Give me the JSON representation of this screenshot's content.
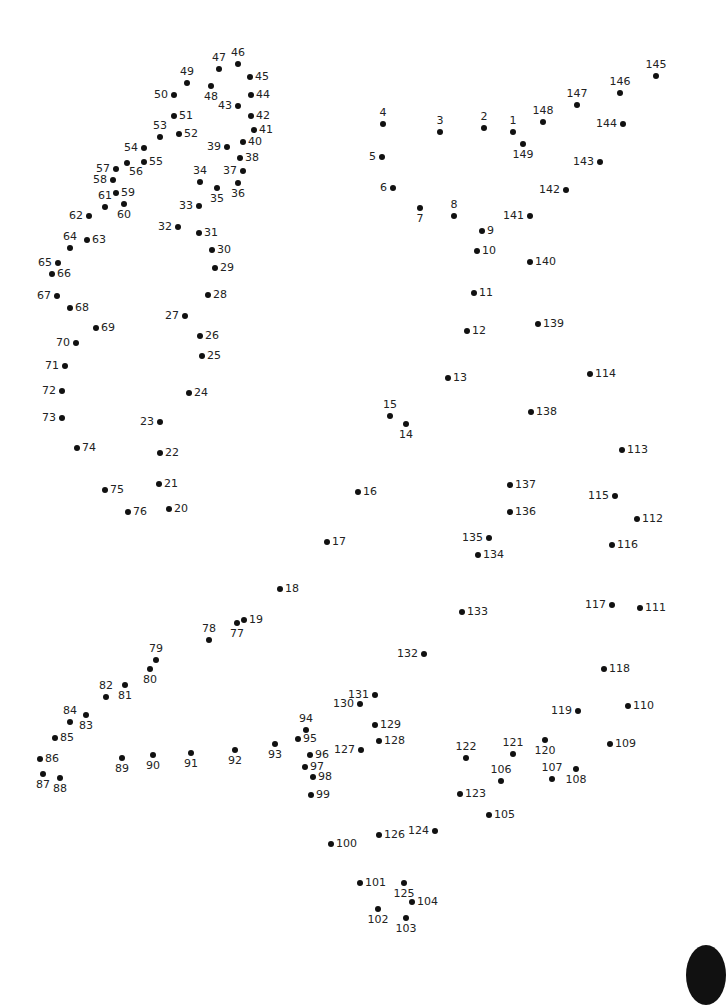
{
  "puzzle": {
    "type": "connect-the-dots",
    "dot_color": "#111111",
    "label_color": "#222222",
    "total_dots": 149,
    "dots": [
      {
        "n": 1,
        "x": 513,
        "y": 132,
        "pos": "above"
      },
      {
        "n": 2,
        "x": 484,
        "y": 128,
        "pos": "above"
      },
      {
        "n": 3,
        "x": 440,
        "y": 132,
        "pos": "above"
      },
      {
        "n": 4,
        "x": 383,
        "y": 124,
        "pos": "above"
      },
      {
        "n": 5,
        "x": 382,
        "y": 157,
        "pos": "left"
      },
      {
        "n": 6,
        "x": 393,
        "y": 188,
        "pos": "left"
      },
      {
        "n": 7,
        "x": 420,
        "y": 208,
        "pos": "below"
      },
      {
        "n": 8,
        "x": 454,
        "y": 216,
        "pos": "above"
      },
      {
        "n": 9,
        "x": 482,
        "y": 231,
        "pos": "right"
      },
      {
        "n": 10,
        "x": 477,
        "y": 251,
        "pos": "right"
      },
      {
        "n": 11,
        "x": 474,
        "y": 293,
        "pos": "right"
      },
      {
        "n": 12,
        "x": 467,
        "y": 331,
        "pos": "right"
      },
      {
        "n": 13,
        "x": 448,
        "y": 378,
        "pos": "right"
      },
      {
        "n": 14,
        "x": 406,
        "y": 424,
        "pos": "below"
      },
      {
        "n": 15,
        "x": 390,
        "y": 416,
        "pos": "above"
      },
      {
        "n": 16,
        "x": 358,
        "y": 492,
        "pos": "right"
      },
      {
        "n": 17,
        "x": 327,
        "y": 542,
        "pos": "right"
      },
      {
        "n": 18,
        "x": 280,
        "y": 589,
        "pos": "right"
      },
      {
        "n": 19,
        "x": 244,
        "y": 620,
        "pos": "right"
      },
      {
        "n": 20,
        "x": 169,
        "y": 509,
        "pos": "right"
      },
      {
        "n": 21,
        "x": 159,
        "y": 484,
        "pos": "right"
      },
      {
        "n": 22,
        "x": 160,
        "y": 453,
        "pos": "right"
      },
      {
        "n": 23,
        "x": 160,
        "y": 422,
        "pos": "left"
      },
      {
        "n": 24,
        "x": 189,
        "y": 393,
        "pos": "right"
      },
      {
        "n": 25,
        "x": 202,
        "y": 356,
        "pos": "right"
      },
      {
        "n": 26,
        "x": 200,
        "y": 336,
        "pos": "right"
      },
      {
        "n": 27,
        "x": 185,
        "y": 316,
        "pos": "left"
      },
      {
        "n": 28,
        "x": 208,
        "y": 295,
        "pos": "right"
      },
      {
        "n": 29,
        "x": 215,
        "y": 268,
        "pos": "right"
      },
      {
        "n": 30,
        "x": 212,
        "y": 250,
        "pos": "right"
      },
      {
        "n": 31,
        "x": 199,
        "y": 233,
        "pos": "right"
      },
      {
        "n": 32,
        "x": 178,
        "y": 227,
        "pos": "left"
      },
      {
        "n": 33,
        "x": 199,
        "y": 206,
        "pos": "left"
      },
      {
        "n": 34,
        "x": 200,
        "y": 182,
        "pos": "above"
      },
      {
        "n": 35,
        "x": 217,
        "y": 188,
        "pos": "below"
      },
      {
        "n": 36,
        "x": 238,
        "y": 183,
        "pos": "below"
      },
      {
        "n": 37,
        "x": 243,
        "y": 171,
        "pos": "left"
      },
      {
        "n": 38,
        "x": 240,
        "y": 158,
        "pos": "right"
      },
      {
        "n": 39,
        "x": 227,
        "y": 147,
        "pos": "left"
      },
      {
        "n": 40,
        "x": 243,
        "y": 142,
        "pos": "right"
      },
      {
        "n": 41,
        "x": 254,
        "y": 130,
        "pos": "right"
      },
      {
        "n": 42,
        "x": 251,
        "y": 116,
        "pos": "right"
      },
      {
        "n": 43,
        "x": 238,
        "y": 106,
        "pos": "left"
      },
      {
        "n": 44,
        "x": 251,
        "y": 95,
        "pos": "right"
      },
      {
        "n": 45,
        "x": 250,
        "y": 77,
        "pos": "right"
      },
      {
        "n": 46,
        "x": 238,
        "y": 64,
        "pos": "above"
      },
      {
        "n": 47,
        "x": 219,
        "y": 69,
        "pos": "above"
      },
      {
        "n": 48,
        "x": 211,
        "y": 86,
        "pos": "below"
      },
      {
        "n": 49,
        "x": 187,
        "y": 83,
        "pos": "above"
      },
      {
        "n": 50,
        "x": 174,
        "y": 95,
        "pos": "left"
      },
      {
        "n": 51,
        "x": 174,
        "y": 116,
        "pos": "right"
      },
      {
        "n": 52,
        "x": 179,
        "y": 134,
        "pos": "right"
      },
      {
        "n": 53,
        "x": 160,
        "y": 137,
        "pos": "above"
      },
      {
        "n": 54,
        "x": 144,
        "y": 148,
        "pos": "left"
      },
      {
        "n": 55,
        "x": 144,
        "y": 162,
        "pos": "right"
      },
      {
        "n": 56,
        "x": 127,
        "y": 163,
        "pos": "below-right"
      },
      {
        "n": 57,
        "x": 116,
        "y": 169,
        "pos": "left"
      },
      {
        "n": 58,
        "x": 113,
        "y": 180,
        "pos": "left"
      },
      {
        "n": 59,
        "x": 116,
        "y": 193,
        "pos": "right"
      },
      {
        "n": 60,
        "x": 124,
        "y": 204,
        "pos": "below"
      },
      {
        "n": 61,
        "x": 105,
        "y": 207,
        "pos": "above"
      },
      {
        "n": 62,
        "x": 89,
        "y": 216,
        "pos": "left"
      },
      {
        "n": 63,
        "x": 87,
        "y": 240,
        "pos": "right"
      },
      {
        "n": 64,
        "x": 70,
        "y": 248,
        "pos": "above"
      },
      {
        "n": 65,
        "x": 58,
        "y": 263,
        "pos": "left"
      },
      {
        "n": 66,
        "x": 52,
        "y": 274,
        "pos": "right"
      },
      {
        "n": 67,
        "x": 57,
        "y": 296,
        "pos": "left"
      },
      {
        "n": 68,
        "x": 70,
        "y": 308,
        "pos": "right"
      },
      {
        "n": 69,
        "x": 96,
        "y": 328,
        "pos": "right"
      },
      {
        "n": 70,
        "x": 76,
        "y": 343,
        "pos": "left"
      },
      {
        "n": 71,
        "x": 65,
        "y": 366,
        "pos": "left"
      },
      {
        "n": 72,
        "x": 62,
        "y": 391,
        "pos": "left"
      },
      {
        "n": 73,
        "x": 62,
        "y": 418,
        "pos": "left"
      },
      {
        "n": 74,
        "x": 77,
        "y": 448,
        "pos": "right"
      },
      {
        "n": 75,
        "x": 105,
        "y": 490,
        "pos": "right"
      },
      {
        "n": 76,
        "x": 128,
        "y": 512,
        "pos": "right"
      },
      {
        "n": 77,
        "x": 237,
        "y": 623,
        "pos": "below"
      },
      {
        "n": 78,
        "x": 209,
        "y": 640,
        "pos": "above"
      },
      {
        "n": 79,
        "x": 156,
        "y": 660,
        "pos": "above"
      },
      {
        "n": 80,
        "x": 150,
        "y": 669,
        "pos": "below"
      },
      {
        "n": 81,
        "x": 125,
        "y": 685,
        "pos": "below"
      },
      {
        "n": 82,
        "x": 106,
        "y": 697,
        "pos": "above"
      },
      {
        "n": 83,
        "x": 86,
        "y": 715,
        "pos": "below"
      },
      {
        "n": 84,
        "x": 70,
        "y": 722,
        "pos": "above"
      },
      {
        "n": 85,
        "x": 55,
        "y": 738,
        "pos": "right"
      },
      {
        "n": 86,
        "x": 40,
        "y": 759,
        "pos": "right"
      },
      {
        "n": 87,
        "x": 43,
        "y": 774,
        "pos": "below"
      },
      {
        "n": 88,
        "x": 60,
        "y": 778,
        "pos": "below"
      },
      {
        "n": 89,
        "x": 122,
        "y": 758,
        "pos": "below"
      },
      {
        "n": 90,
        "x": 153,
        "y": 755,
        "pos": "below"
      },
      {
        "n": 91,
        "x": 191,
        "y": 753,
        "pos": "below"
      },
      {
        "n": 92,
        "x": 235,
        "y": 750,
        "pos": "below"
      },
      {
        "n": 93,
        "x": 275,
        "y": 744,
        "pos": "below"
      },
      {
        "n": 94,
        "x": 306,
        "y": 730,
        "pos": "above"
      },
      {
        "n": 95,
        "x": 298,
        "y": 739,
        "pos": "right"
      },
      {
        "n": 96,
        "x": 310,
        "y": 755,
        "pos": "right"
      },
      {
        "n": 97,
        "x": 305,
        "y": 767,
        "pos": "right"
      },
      {
        "n": 98,
        "x": 313,
        "y": 777,
        "pos": "right"
      },
      {
        "n": 99,
        "x": 311,
        "y": 795,
        "pos": "right"
      },
      {
        "n": 100,
        "x": 331,
        "y": 844,
        "pos": "right"
      },
      {
        "n": 101,
        "x": 360,
        "y": 883,
        "pos": "right"
      },
      {
        "n": 102,
        "x": 378,
        "y": 909,
        "pos": "below"
      },
      {
        "n": 103,
        "x": 406,
        "y": 918,
        "pos": "below"
      },
      {
        "n": 104,
        "x": 412,
        "y": 902,
        "pos": "right"
      },
      {
        "n": 105,
        "x": 489,
        "y": 815,
        "pos": "right"
      },
      {
        "n": 106,
        "x": 501,
        "y": 781,
        "pos": "above"
      },
      {
        "n": 107,
        "x": 552,
        "y": 779,
        "pos": "above"
      },
      {
        "n": 108,
        "x": 576,
        "y": 769,
        "pos": "below"
      },
      {
        "n": 109,
        "x": 610,
        "y": 744,
        "pos": "right"
      },
      {
        "n": 110,
        "x": 628,
        "y": 706,
        "pos": "right"
      },
      {
        "n": 111,
        "x": 640,
        "y": 608,
        "pos": "right"
      },
      {
        "n": 112,
        "x": 637,
        "y": 519,
        "pos": "right"
      },
      {
        "n": 113,
        "x": 622,
        "y": 450,
        "pos": "right"
      },
      {
        "n": 114,
        "x": 590,
        "y": 374,
        "pos": "right"
      },
      {
        "n": 115,
        "x": 615,
        "y": 496,
        "pos": "left"
      },
      {
        "n": 116,
        "x": 612,
        "y": 545,
        "pos": "right"
      },
      {
        "n": 117,
        "x": 612,
        "y": 605,
        "pos": "left"
      },
      {
        "n": 118,
        "x": 604,
        "y": 669,
        "pos": "right"
      },
      {
        "n": 119,
        "x": 578,
        "y": 711,
        "pos": "left"
      },
      {
        "n": 120,
        "x": 545,
        "y": 740,
        "pos": "below"
      },
      {
        "n": 121,
        "x": 513,
        "y": 754,
        "pos": "above"
      },
      {
        "n": 122,
        "x": 466,
        "y": 758,
        "pos": "above"
      },
      {
        "n": 123,
        "x": 460,
        "y": 794,
        "pos": "right"
      },
      {
        "n": 124,
        "x": 435,
        "y": 831,
        "pos": "left"
      },
      {
        "n": 125,
        "x": 404,
        "y": 883,
        "pos": "below"
      },
      {
        "n": 126,
        "x": 379,
        "y": 835,
        "pos": "right"
      },
      {
        "n": 127,
        "x": 361,
        "y": 750,
        "pos": "left"
      },
      {
        "n": 128,
        "x": 379,
        "y": 741,
        "pos": "right"
      },
      {
        "n": 129,
        "x": 375,
        "y": 725,
        "pos": "right"
      },
      {
        "n": 130,
        "x": 360,
        "y": 704,
        "pos": "left"
      },
      {
        "n": 131,
        "x": 375,
        "y": 695,
        "pos": "left"
      },
      {
        "n": 132,
        "x": 424,
        "y": 654,
        "pos": "left"
      },
      {
        "n": 133,
        "x": 462,
        "y": 612,
        "pos": "right"
      },
      {
        "n": 134,
        "x": 478,
        "y": 555,
        "pos": "right"
      },
      {
        "n": 135,
        "x": 489,
        "y": 538,
        "pos": "left"
      },
      {
        "n": 136,
        "x": 510,
        "y": 512,
        "pos": "right"
      },
      {
        "n": 137,
        "x": 510,
        "y": 485,
        "pos": "right"
      },
      {
        "n": 138,
        "x": 531,
        "y": 412,
        "pos": "right"
      },
      {
        "n": 139,
        "x": 538,
        "y": 324,
        "pos": "right"
      },
      {
        "n": 140,
        "x": 530,
        "y": 262,
        "pos": "right"
      },
      {
        "n": 141,
        "x": 530,
        "y": 216,
        "pos": "left"
      },
      {
        "n": 142,
        "x": 566,
        "y": 190,
        "pos": "left"
      },
      {
        "n": 143,
        "x": 600,
        "y": 162,
        "pos": "left"
      },
      {
        "n": 144,
        "x": 623,
        "y": 124,
        "pos": "left"
      },
      {
        "n": 145,
        "x": 656,
        "y": 76,
        "pos": "above"
      },
      {
        "n": 146,
        "x": 620,
        "y": 93,
        "pos": "above"
      },
      {
        "n": 147,
        "x": 577,
        "y": 105,
        "pos": "above"
      },
      {
        "n": 148,
        "x": 543,
        "y": 122,
        "pos": "above"
      },
      {
        "n": 149,
        "x": 523,
        "y": 144,
        "pos": "below"
      }
    ]
  }
}
